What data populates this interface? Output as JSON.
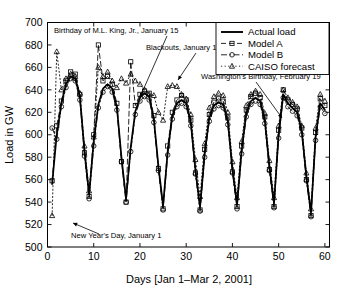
{
  "chart_data": {
    "type": "line",
    "title": "",
    "xlabel": "Days [Jan 1–Mar 2, 2001]",
    "ylabel": "Load in GW",
    "xlim": [
      0,
      61
    ],
    "ylim": [
      500,
      700
    ],
    "xticks": [
      0,
      10,
      20,
      30,
      40,
      50,
      60
    ],
    "xticklabels": [
      "0",
      "10",
      "20",
      "30",
      "40",
      "50",
      "60"
    ],
    "yticks": [
      500,
      520,
      540,
      560,
      580,
      600,
      620,
      640,
      660,
      680,
      700
    ],
    "yticklabels": [
      "500",
      "520",
      "540",
      "560",
      "580",
      "600",
      "620",
      "640",
      "660",
      "680",
      "700"
    ],
    "grid": false,
    "legend_position": "upper right",
    "x": [
      1,
      2,
      3,
      4,
      5,
      6,
      7,
      8,
      9,
      10,
      11,
      12,
      13,
      14,
      15,
      16,
      17,
      18,
      19,
      20,
      21,
      22,
      23,
      24,
      25,
      26,
      27,
      28,
      29,
      30,
      31,
      32,
      33,
      34,
      35,
      36,
      37,
      38,
      39,
      40,
      41,
      42,
      43,
      44,
      45,
      46,
      47,
      48,
      49,
      50,
      51,
      52,
      53,
      54,
      55,
      56,
      57,
      58,
      59,
      60
    ],
    "series": [
      {
        "name": "Actual load",
        "style": "solid",
        "marker": "none",
        "color": "#000000",
        "values": [
          556,
          600,
          628,
          645,
          652,
          650,
          634,
          586,
          547,
          594,
          627,
          641,
          645,
          641,
          625,
          580,
          543,
          589,
          621,
          633,
          637,
          634,
          614,
          572,
          537,
          585,
          617,
          628,
          631,
          628,
          611,
          569,
          536,
          583,
          615,
          626,
          629,
          627,
          612,
          570,
          538,
          586,
          619,
          630,
          633,
          630,
          613,
          572,
          539,
          600,
          636,
          628,
          624,
          620,
          603,
          563,
          531,
          598,
          628,
          622
        ]
      },
      {
        "name": "Model A",
        "style": "dashed",
        "marker": "square",
        "color": "#000000",
        "values": [
          559,
          608,
          630,
          648,
          656,
          654,
          636,
          584,
          545,
          600,
          680,
          648,
          652,
          645,
          628,
          576,
          540,
          665,
          626,
          636,
          639,
          637,
          617,
          570,
          534,
          590,
          620,
          631,
          635,
          631,
          613,
          566,
          533,
          587,
          618,
          629,
          632,
          630,
          615,
          567,
          536,
          590,
          622,
          634,
          637,
          633,
          616,
          569,
          536,
          604,
          640,
          631,
          627,
          623,
          606,
          560,
          528,
          602,
          632,
          626
        ]
      },
      {
        "name": "Model B",
        "style": "dashdot",
        "marker": "circle",
        "color": "#000000",
        "values": [
          606,
          596,
          625,
          642,
          650,
          648,
          631,
          581,
          543,
          590,
          624,
          638,
          643,
          638,
          622,
          576,
          540,
          585,
          618,
          630,
          634,
          631,
          611,
          568,
          533,
          582,
          614,
          625,
          628,
          625,
          608,
          565,
          532,
          580,
          612,
          623,
          626,
          624,
          609,
          566,
          534,
          583,
          616,
          627,
          630,
          627,
          610,
          568,
          535,
          597,
          633,
          625,
          621,
          617,
          600,
          559,
          527,
          595,
          625,
          619
        ]
      },
      {
        "name": "CAISO forecast",
        "style": "dotted",
        "marker": "triangle",
        "color": "#000000",
        "values": [
          528,
          674,
          640,
          650,
          654,
          652,
          637,
          590,
          550,
          598,
          660,
          652,
          656,
          648,
          642,
          650,
          646,
          654,
          648,
          645,
          640,
          636,
          635,
          620,
          613,
          643,
          644,
          643,
          636,
          632,
          618,
          578,
          545,
          592,
          624,
          634,
          637,
          635,
          620,
          576,
          544,
          594,
          626,
          636,
          639,
          636,
          619,
          577,
          544,
          608,
          640,
          633,
          629,
          625,
          608,
          566,
          534,
          606,
          636,
          630
        ]
      }
    ],
    "annotations": [
      {
        "text": "Birthday of M.L. King, Jr., January 15",
        "x_day": 15
      },
      {
        "text": "Blackouts, January 17–18",
        "x_day": 17
      },
      {
        "text": "Washington's Birthday, February 19",
        "x_day": 50
      },
      {
        "text": "New Year's Day, January 1",
        "x_day": 1
      }
    ]
  },
  "legend": {
    "entries": [
      {
        "label": "Actual load"
      },
      {
        "label": "Model A"
      },
      {
        "label": "Model B"
      },
      {
        "label": "CAISO forecast"
      }
    ]
  }
}
